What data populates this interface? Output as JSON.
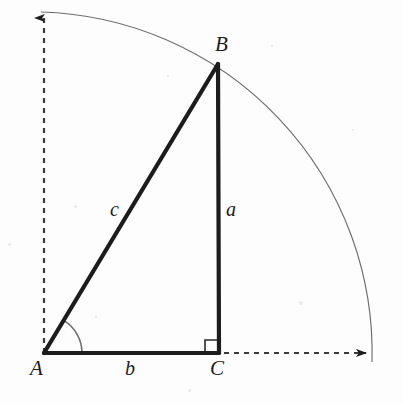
{
  "figure": {
    "type": "geometry-diagram",
    "background_color": "#fdfdfd",
    "stroke_color": "#1c1c1c",
    "thin_stroke_color": "#6e6e6e",
    "canvas": {
      "width": 403,
      "height": 403
    }
  },
  "points": {
    "A": {
      "x": 44,
      "y": 353
    },
    "B": {
      "x": 218,
      "y": 64
    },
    "C": {
      "x": 219,
      "y": 353
    }
  },
  "vertex_labels": [
    {
      "id": "A",
      "text": "A",
      "x": 30,
      "y": 358
    },
    {
      "id": "B",
      "text": "B",
      "x": 215,
      "y": 34
    },
    {
      "id": "C",
      "text": "C",
      "x": 210,
      "y": 358
    }
  ],
  "side_labels": [
    {
      "id": "a",
      "text": "a",
      "x": 226,
      "y": 199
    },
    {
      "id": "b",
      "text": "b",
      "x": 125,
      "y": 358
    },
    {
      "id": "c",
      "text": "c",
      "x": 110,
      "y": 199
    }
  ],
  "triangle": {
    "sides": [
      {
        "name": "hypotenuse-c",
        "from": "A",
        "to": "B"
      },
      {
        "name": "leg-a",
        "from": "B",
        "to": "C"
      },
      {
        "name": "leg-b",
        "from": "A",
        "to": "C"
      }
    ],
    "stroke_width": 4
  },
  "angle_marker": {
    "name": "angle-at-A",
    "center": "A",
    "radius": 38,
    "start_deg": 0,
    "end_deg": 59
  },
  "right_angle_marker": {
    "name": "right-angle-at-C",
    "x": 205,
    "y": 340,
    "size": 12
  },
  "axes": [
    {
      "name": "vertical-axis",
      "x1": 44,
      "y1": 353,
      "x2": 44,
      "y2": 18,
      "dashed": true,
      "arrow": "up"
    },
    {
      "name": "horizontal-axis",
      "x1": 44,
      "y1": 353,
      "x2": 366,
      "y2": 353,
      "dashed": true,
      "arrow": "right"
    }
  ],
  "arc": {
    "name": "quarter-circle-arc",
    "center": "A",
    "radius": 341,
    "from": {
      "x": 41,
      "y": 12
    },
    "to": {
      "x": 372,
      "y": 362
    },
    "stroke_width": 1
  },
  "specks": [
    {
      "x": 74,
      "y": 205,
      "size": 3
    },
    {
      "x": 299,
      "y": 301,
      "size": 4
    },
    {
      "x": 167,
      "y": 75,
      "size": 2
    },
    {
      "x": 8,
      "y": 243,
      "size": 3
    },
    {
      "x": 352,
      "y": 129,
      "size": 2
    },
    {
      "x": 188,
      "y": 389,
      "size": 3
    },
    {
      "x": 271,
      "y": 45,
      "size": 2
    },
    {
      "x": 95,
      "y": 316,
      "size": 2
    }
  ]
}
